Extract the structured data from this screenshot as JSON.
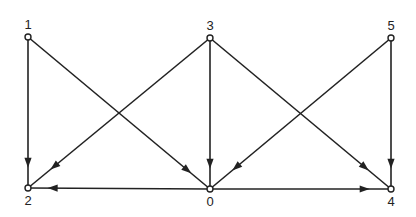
{
  "diagram": {
    "type": "directed-graph",
    "colors": {
      "ink": "#222222",
      "background": "#ffffff"
    },
    "nodes": [
      {
        "id": "1",
        "label": "1",
        "x": 28,
        "y": 37,
        "label_pos": "above"
      },
      {
        "id": "3",
        "label": "3",
        "x": 210,
        "y": 38,
        "label_pos": "above"
      },
      {
        "id": "5",
        "label": "5",
        "x": 391,
        "y": 38,
        "label_pos": "above"
      },
      {
        "id": "2",
        "label": "2",
        "x": 28,
        "y": 188,
        "label_pos": "below"
      },
      {
        "id": "0",
        "label": "0",
        "x": 210,
        "y": 189,
        "label_pos": "below"
      },
      {
        "id": "4",
        "label": "4",
        "x": 391,
        "y": 189,
        "label_pos": "below"
      }
    ],
    "edges": [
      {
        "from": "1",
        "to": "2",
        "arrow_at": 0.84
      },
      {
        "from": "1",
        "to": "0",
        "arrow_at": 0.88
      },
      {
        "from": "3",
        "to": "2",
        "arrow_at": 0.86
      },
      {
        "from": "3",
        "to": "0",
        "arrow_at": 0.84
      },
      {
        "from": "3",
        "to": "4",
        "arrow_at": 0.86
      },
      {
        "from": "5",
        "to": "0",
        "arrow_at": 0.86
      },
      {
        "from": "5",
        "to": "4",
        "arrow_at": 0.84
      },
      {
        "from": "0",
        "to": "2",
        "arrow_at": 0.87
      },
      {
        "from": "0",
        "to": "4",
        "arrow_at": 0.86
      }
    ]
  }
}
